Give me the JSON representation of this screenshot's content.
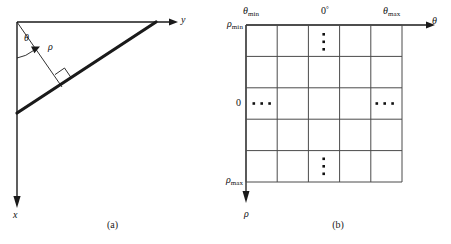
{
  "figure": {
    "panels": [
      {
        "id": "a",
        "caption": "(a)",
        "description": "Normal (rho, theta) representation of a line in the xy-plane",
        "labels": {
          "theta": "θ",
          "rho": "ρ",
          "y_axis": "y",
          "x_axis": "x"
        },
        "geometry": {
          "origin": [
            17,
            22
          ],
          "y_axis_end": [
            176,
            22
          ],
          "x_axis_end": [
            17,
            208
          ],
          "line_start": [
            17,
            112
          ],
          "line_end": [
            155,
            22
          ],
          "foot_of_perpendicular": [
            60,
            85
          ],
          "right_angle_marker": true,
          "angle_arc_label": "θ"
        }
      },
      {
        "id": "b",
        "caption": "(b)",
        "description": "Subdivision of the rho-theta plane into accumulator cells",
        "labels": {
          "theta_min": "θ",
          "theta_min_sub": "min",
          "theta_max": "θ",
          "theta_max_sub": "max",
          "zero_degrees": "0",
          "zero_degrees_sup": "°",
          "rho_min": "ρ",
          "rho_min_sub": "min",
          "rho_max": "ρ",
          "rho_max_sub": "max",
          "rho_zero": "0",
          "theta_axis": "θ",
          "rho_axis": "ρ"
        },
        "grid": {
          "columns": 5,
          "rows": 5,
          "left": 21,
          "top": 25,
          "cell_width": 31.2,
          "cell_height": 31.4,
          "dot_groups": [
            {
              "name": "top-vertical-ellipsis",
              "orientation": "vertical",
              "col": 2,
              "row": 0,
              "count": 3
            },
            {
              "name": "left-horizontal-ellipsis",
              "orientation": "horizontal",
              "col": 0,
              "row": 2,
              "count": 3
            },
            {
              "name": "right-horizontal-ellipsis",
              "orientation": "horizontal",
              "col": 4,
              "row": 2,
              "count": 3
            },
            {
              "name": "bottom-vertical-ellipsis",
              "orientation": "vertical",
              "col": 2,
              "row": 4,
              "count": 3
            }
          ]
        },
        "geometry": {
          "theta_axis_end": [
            208,
            25
          ],
          "rho_axis_end": [
            21,
            202
          ]
        }
      }
    ]
  },
  "style": {
    "stroke": "#1a1a1a",
    "thick_stroke": "#1a1a1a",
    "background": "#ffffff",
    "grid_stroke": "#555555",
    "dot_fill": "#111111"
  }
}
